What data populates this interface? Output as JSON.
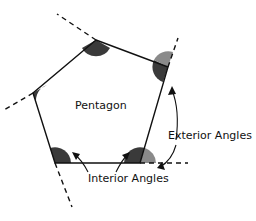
{
  "figure": {
    "shape_label": "Pentagon",
    "exterior_label": "Exterior Angles",
    "interior_label": "Interior Angles",
    "colors": {
      "interior_fill": "#3a3a3a",
      "exterior_fill": "#8a8a8a",
      "stroke": "#111111",
      "background": "#ffffff"
    }
  }
}
